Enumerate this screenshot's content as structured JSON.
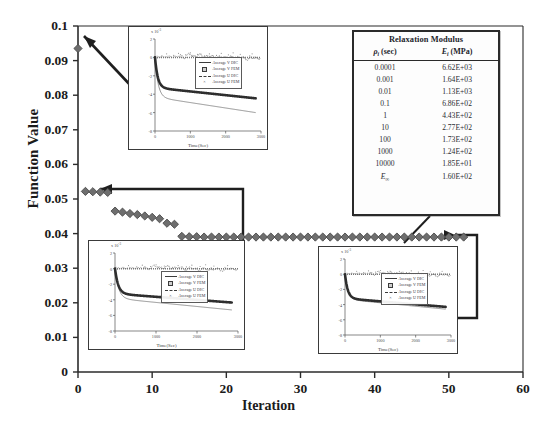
{
  "figure": {
    "x_axis_title": "Iteration",
    "y_axis_title": "Function Value",
    "x_ticks": [
      "0",
      "10",
      "20",
      "30",
      "40",
      "50",
      "60"
    ],
    "y_ticks": [
      "0",
      "0.01",
      "0.02",
      "0.03",
      "0.04",
      "0.05",
      "0.06",
      "0.07",
      "0.08",
      "0.09",
      "0.1"
    ]
  },
  "table": {
    "title": "Relaxation Modulus",
    "col_rho": "ρ",
    "col_rho_sub": "i",
    "col_rho_unit": " (sec)",
    "col_e": "E",
    "col_e_sub": "i",
    "col_e_unit": " (MPa)",
    "rows": [
      {
        "rho": "0.0001",
        "e": "6.62E+03"
      },
      {
        "rho": "0.001",
        "e": "1.64E+03"
      },
      {
        "rho": "0.01",
        "e": "1.13E+03"
      },
      {
        "rho": "0.1",
        "e": "6.86E+02"
      },
      {
        "rho": "1",
        "e": "4.43E+02"
      },
      {
        "rho": "10",
        "e": "2.77E+02"
      },
      {
        "rho": "100",
        "e": "1.73E+02"
      },
      {
        "rho": "1000",
        "e": "1.24E+02"
      },
      {
        "rho": "10000",
        "e": "1.85E+01"
      }
    ],
    "last_row": {
      "rho_symbol": "E",
      "rho_sub": "∞",
      "e": "1.60E+02"
    }
  },
  "insets": {
    "common": {
      "y_title": "Displacement (mm)",
      "x_title": "Time(Sec)",
      "x_ticks": [
        "0",
        "1000",
        "2000",
        "3000"
      ],
      "y_ticks": [
        "2",
        "0",
        "-2",
        "-4",
        "-6",
        "-8"
      ],
      "exponent": "x 10",
      "exponent_sup": "-3",
      "legend": [
        {
          "label": "Average V DIC",
          "key": "solid-line"
        },
        {
          "label": "Average V FEM",
          "key": "square-marker"
        },
        {
          "label": "Average U DIC",
          "key": "dashed-line"
        },
        {
          "label": "Average U FEM",
          "key": "cross-marker"
        }
      ]
    },
    "top": {
      "name": "inset-top-iteration-0"
    },
    "bottom_left": {
      "name": "inset-bottom-left-iteration-10"
    },
    "bottom_right": {
      "name": "inset-bottom-right-iteration-52"
    }
  },
  "chart_data": {
    "type": "line",
    "title": "",
    "xlabel": "Iteration",
    "ylabel": "Function Value",
    "xlim": [
      0,
      60
    ],
    "ylim": [
      0,
      0.1
    ],
    "grid": false,
    "marker": "diamond",
    "marker_color": "#6e6e6e",
    "series": [
      {
        "name": "Objective function value",
        "x": [
          0,
          1,
          2,
          3,
          4,
          5,
          6,
          7,
          8,
          9,
          10,
          11,
          12,
          13,
          14,
          15,
          16,
          17,
          18,
          19,
          20,
          21,
          22,
          23,
          24,
          25,
          26,
          27,
          28,
          29,
          30,
          31,
          32,
          33,
          34,
          35,
          36,
          37,
          38,
          39,
          40,
          41,
          42,
          43,
          44,
          45,
          46,
          47,
          48,
          49,
          50,
          51,
          52
        ],
        "y": [
          0.0935,
          0.0522,
          0.0521,
          0.052,
          0.0519,
          0.0465,
          0.0462,
          0.0458,
          0.0455,
          0.0451,
          0.0447,
          0.0443,
          0.043,
          0.0427,
          0.0392,
          0.0391,
          0.0391,
          0.039,
          0.039,
          0.039,
          0.039,
          0.039,
          0.039,
          0.039,
          0.039,
          0.039,
          0.039,
          0.039,
          0.039,
          0.039,
          0.039,
          0.039,
          0.039,
          0.039,
          0.039,
          0.039,
          0.039,
          0.039,
          0.039,
          0.039,
          0.039,
          0.039,
          0.039,
          0.039,
          0.039,
          0.039,
          0.039,
          0.039,
          0.039,
          0.039,
          0.039,
          0.039,
          0.039
        ]
      }
    ]
  }
}
